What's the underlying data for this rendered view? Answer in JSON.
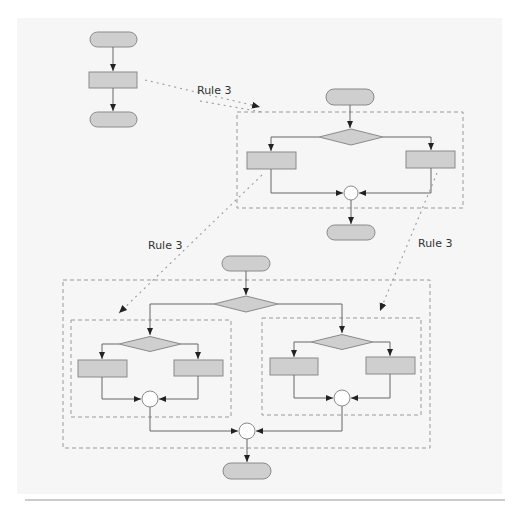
{
  "colors": {
    "page_bg": "#ffffff",
    "panel_bg": "#f6f6f6",
    "shape_fill": "#cfcfcf",
    "shape_stroke": "#8a8a8a",
    "line": "#666666",
    "dash": "#9a9a9a",
    "rule_line": "#999999"
  },
  "labels": {
    "rule_top": "Rule 3",
    "rule_left": "Rule 3",
    "rule_right": "Rule 3"
  },
  "diagram": {
    "panel": {
      "x": 17,
      "y": 18,
      "w": 485,
      "h": 476
    },
    "bottom_rule": {
      "x1": 25,
      "x2": 505,
      "y": 500
    },
    "sequence_block": {
      "start_terminal": {
        "x": 90,
        "y": 32,
        "w": 47,
        "h": 15
      },
      "process": {
        "x": 89,
        "y": 72,
        "w": 48,
        "h": 16
      },
      "end_terminal": {
        "x": 90,
        "y": 112,
        "w": 47,
        "h": 15
      }
    },
    "selection_block": {
      "container": {
        "x": 237,
        "y": 112,
        "w": 226,
        "h": 96
      },
      "start_terminal": {
        "x": 326,
        "y": 89,
        "w": 48,
        "h": 16
      },
      "decision": {
        "cx": 351,
        "cy": 137,
        "w": 64,
        "h": 16
      },
      "process_left": {
        "x": 247,
        "y": 152,
        "w": 49,
        "h": 17
      },
      "process_right": {
        "x": 406,
        "y": 151,
        "w": 49,
        "h": 17
      },
      "merge": {
        "cx": 351,
        "cy": 193,
        "r": 7
      },
      "end_terminal": {
        "x": 327,
        "y": 225,
        "w": 48,
        "h": 15
      }
    },
    "nested_block": {
      "container": {
        "x": 63,
        "y": 280,
        "w": 367,
        "h": 168
      },
      "start_terminal": {
        "x": 222,
        "y": 256,
        "w": 48,
        "h": 15
      },
      "decision": {
        "cx": 246,
        "cy": 304,
        "w": 64,
        "h": 16
      },
      "left_sub": {
        "container": {
          "x": 71,
          "y": 320,
          "w": 160,
          "h": 97
        },
        "decision": {
          "cx": 150,
          "cy": 344,
          "w": 62,
          "h": 15
        },
        "process_left": {
          "x": 78,
          "y": 360,
          "w": 49,
          "h": 17
        },
        "process_right": {
          "x": 174,
          "y": 360,
          "w": 49,
          "h": 16
        },
        "merge": {
          "cx": 150,
          "cy": 399,
          "r": 8
        }
      },
      "right_sub": {
        "container": {
          "x": 262,
          "y": 318,
          "w": 159,
          "h": 97
        },
        "decision": {
          "cx": 342,
          "cy": 342,
          "w": 62,
          "h": 15
        },
        "process_left": {
          "x": 270,
          "y": 358,
          "w": 48,
          "h": 17
        },
        "process_right": {
          "x": 366,
          "y": 357,
          "w": 49,
          "h": 17
        },
        "merge": {
          "cx": 342,
          "cy": 398,
          "r": 8
        }
      },
      "merge": {
        "cx": 247,
        "cy": 431,
        "r": 8
      },
      "end_terminal": {
        "x": 223,
        "y": 463,
        "w": 48,
        "h": 16
      }
    }
  }
}
